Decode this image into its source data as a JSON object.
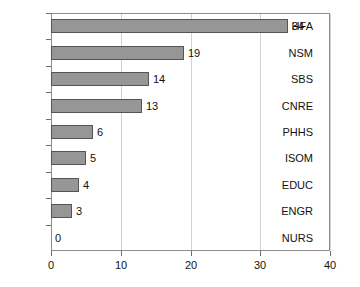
{
  "chart_data": {
    "type": "bar",
    "orientation": "horizontal",
    "title": "",
    "xlabel": "",
    "ylabel": "",
    "categories": [
      "HFA",
      "NSM",
      "SBS",
      "CNRE",
      "PHHS",
      "ISOM",
      "EDUC",
      "ENGR",
      "NURS"
    ],
    "values": [
      34,
      19,
      14,
      13,
      6,
      5,
      4,
      3,
      0
    ],
    "data_labels": [
      "34",
      "19",
      "14",
      "13",
      "6",
      "5",
      "4",
      "3",
      "0"
    ],
    "xlim": [
      0,
      40
    ],
    "xticks": [
      0,
      10,
      20,
      30,
      40
    ],
    "xtick_labels": [
      "0",
      "10",
      "20",
      "30",
      "40"
    ],
    "grid": "vertical",
    "legend": "none",
    "bar_color": "#969696",
    "bar_edge_color": "#555555",
    "gridline_color": "#d2d2d2",
    "axis_color": "#8c8c8c",
    "background": "#ffffff"
  }
}
